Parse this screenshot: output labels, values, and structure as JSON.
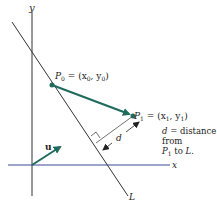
{
  "diagram": {
    "axes": {
      "x_label": "x",
      "y_label": "y"
    },
    "line_label": "L",
    "p0": {
      "name": "P",
      "sub": "0",
      "coords": "= (x",
      "c1sub": "0",
      "sep": ", y",
      "c2sub": "0",
      "close": ")"
    },
    "p1": {
      "name": "P",
      "sub": "1",
      "coords": "= (x",
      "c1sub": "1",
      "sep": ", y",
      "c2sub": "1",
      "close": ")"
    },
    "u_label": "u",
    "d_label": "d",
    "note": {
      "line1_var": "d",
      "line1_rest": " = distance",
      "line2": "from",
      "line3_var": "P",
      "line3_sub": "1",
      "line3_rest": " to ",
      "line3_L": "L",
      "line3_end": "."
    },
    "colors": {
      "vector": "#1f6b5e",
      "x_axis": "#3a4a9a",
      "axis": "#333333",
      "line": "#333333"
    }
  }
}
